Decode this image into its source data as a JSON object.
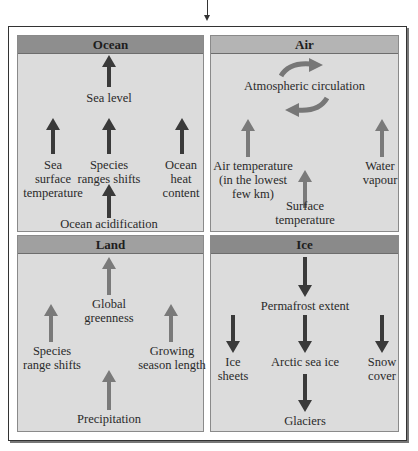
{
  "colors": {
    "ocean_header": "#8e8e8e",
    "air_header": "#b4b4b4",
    "land_header": "#a0a0a0",
    "ice_header": "#8a8a8a",
    "panel_bg": "#dcdcdc",
    "arrow_dark": "#3a3a3a",
    "arrow_light": "#7a7a7a"
  },
  "panels": {
    "ocean": {
      "title": "Ocean",
      "labels": {
        "sea_level": "Sea level",
        "sst_1": "Sea",
        "sst_2": "surface",
        "sst_3": "temperature",
        "species_1": "Species",
        "species_2": "ranges shifts",
        "heat_1": "Ocean",
        "heat_2": "heat",
        "heat_3": "content",
        "acid": "Ocean acidification"
      },
      "arrows": [
        {
          "to": "Sea level",
          "direction": "up"
        },
        {
          "to": "Sea surface temperature",
          "direction": "up"
        },
        {
          "to": "Species ranges shifts",
          "direction": "up"
        },
        {
          "to": "Ocean heat content",
          "direction": "up"
        },
        {
          "to": "Ocean acidification",
          "direction": "up"
        }
      ]
    },
    "air": {
      "title": "Air",
      "labels": {
        "circ": "Atmospheric circulation",
        "airtemp_1": "Air temperature",
        "airtemp_2": "(in the lowest",
        "airtemp_3": "few km)",
        "wv_1": "Water",
        "wv_2": "vapour",
        "surf_1": "Surface",
        "surf_2": "temperature"
      },
      "arrows": [
        {
          "to": "Atmospheric circulation",
          "direction": "circular"
        },
        {
          "to": "Air temperature",
          "direction": "up"
        },
        {
          "to": "Water vapour",
          "direction": "up"
        },
        {
          "to": "Surface temperature",
          "direction": "up"
        }
      ]
    },
    "land": {
      "title": "Land",
      "labels": {
        "green_1": "Global",
        "green_2": "greenness",
        "spec_1": "Species",
        "spec_2": "range shifts",
        "grow_1": "Growing",
        "grow_2": "season length",
        "precip": "Precipitation"
      },
      "arrows": [
        {
          "to": "Global greenness",
          "direction": "up"
        },
        {
          "to": "Species range shifts",
          "direction": "up"
        },
        {
          "to": "Growing season length",
          "direction": "up"
        },
        {
          "to": "Precipitation",
          "direction": "up"
        }
      ]
    },
    "ice": {
      "title": "Ice",
      "labels": {
        "perma": "Permafrost extent",
        "sheets_1": "Ice",
        "sheets_2": "sheets",
        "arctic": "Arctic sea ice",
        "snow_1": "Snow",
        "snow_2": "cover",
        "glaciers": "Glaciers"
      },
      "arrows": [
        {
          "to": "Permafrost extent",
          "direction": "down"
        },
        {
          "to": "Ice sheets",
          "direction": "down"
        },
        {
          "to": "Arctic sea ice",
          "direction": "down"
        },
        {
          "to": "Snow cover",
          "direction": "down"
        },
        {
          "to": "Glaciers",
          "direction": "down"
        }
      ]
    }
  }
}
